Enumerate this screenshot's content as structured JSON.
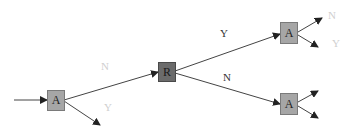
{
  "nodes": {
    "start": {
      "label": "A",
      "color": "#a6a6a6"
    },
    "middle": {
      "label": "R",
      "color": "#6b6b6b"
    },
    "top_right": {
      "label": "A",
      "color": "#a6a6a6"
    },
    "bottom_right": {
      "label": "A",
      "color": "#a6a6a6"
    }
  },
  "edges": {
    "start_to_middle": {
      "label": "N"
    },
    "start_out": {
      "label": "Y"
    },
    "middle_to_top": {
      "label": "Y"
    },
    "middle_to_bottom": {
      "label": "N"
    },
    "top_out_upper": {
      "label": "N"
    },
    "top_out_lower": {
      "label": "Y"
    }
  },
  "colors": {
    "edge": "#333333",
    "faint_label": "#cfcfcf",
    "dark_label": "#333333"
  }
}
